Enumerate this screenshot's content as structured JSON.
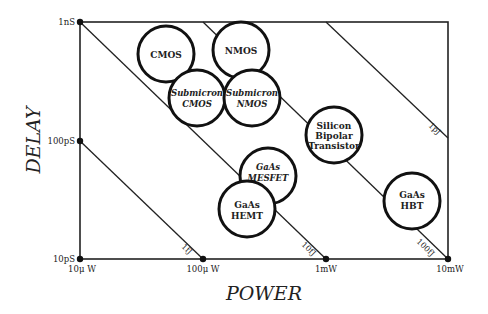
{
  "diagram": {
    "type": "delay-power tradeoff diagram",
    "axes": {
      "x_title": "POWER",
      "y_title": "DELAY",
      "x_ticks": [
        "10μ W",
        "100μ W",
        "1mW",
        "10mW"
      ],
      "y_ticks": [
        "10pS",
        "100pS",
        "1nS"
      ]
    },
    "energy_lines": [
      {
        "label": "1fJ"
      },
      {
        "label": "10fJ"
      },
      {
        "label": "100fJ"
      },
      {
        "label": "1pJ"
      }
    ],
    "technologies": [
      {
        "id": "cmos",
        "lines": [
          "CMOS"
        ],
        "italic": false
      },
      {
        "id": "nmos",
        "lines": [
          "NMOS"
        ],
        "italic": false
      },
      {
        "id": "submicron-cmos",
        "lines": [
          "Submicron",
          "CMOS"
        ],
        "italic": true
      },
      {
        "id": "submicron-nmos",
        "lines": [
          "Submicron",
          "NMOS"
        ],
        "italic": true
      },
      {
        "id": "silicon-bipolar",
        "lines": [
          "Silicon",
          "Bipolar",
          "Transistor"
        ],
        "italic": false
      },
      {
        "id": "gaas-mesfet",
        "lines": [
          "GaAs",
          "MESFET"
        ],
        "italic": true
      },
      {
        "id": "gaas-hemt",
        "lines": [
          "GaAs",
          "HEMT"
        ],
        "italic": false
      },
      {
        "id": "gaas-hbt",
        "lines": [
          "GaAs",
          "HBT"
        ],
        "italic": false
      }
    ]
  }
}
